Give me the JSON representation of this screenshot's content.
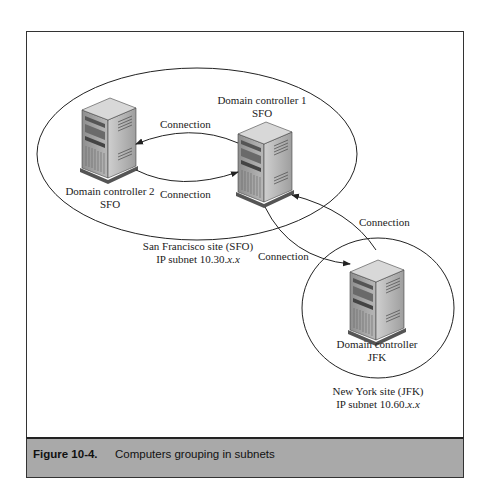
{
  "figure": {
    "number": "Figure 10-4.",
    "title": "Computers grouping in subnets"
  },
  "nodes": {
    "dc1": {
      "line1": "Domain controller 1",
      "line2": "SFO"
    },
    "dc2": {
      "line1": "Domain controller 2",
      "line2": "SFO"
    },
    "jfk": {
      "line1": "Domain controller",
      "line2": "JFK"
    }
  },
  "sites": {
    "sfo": {
      "line1": "San Francisco site (SFO)",
      "line2_prefix": "IP subnet 10.30.",
      "line2_suffix": "x.x"
    },
    "jfk": {
      "line1": "New York site (JFK)",
      "line2_prefix": "IP subnet 10.60.",
      "line2_suffix": "x.x"
    }
  },
  "connections": {
    "dc1_to_dc2": "Connection",
    "dc2_to_dc1": "Connection",
    "jfk_to_dc1": "Connection",
    "dc1_to_jfk": "Connection"
  },
  "colors": {
    "caption_bg": "#a9a9a9",
    "frame_border": "#333333"
  }
}
